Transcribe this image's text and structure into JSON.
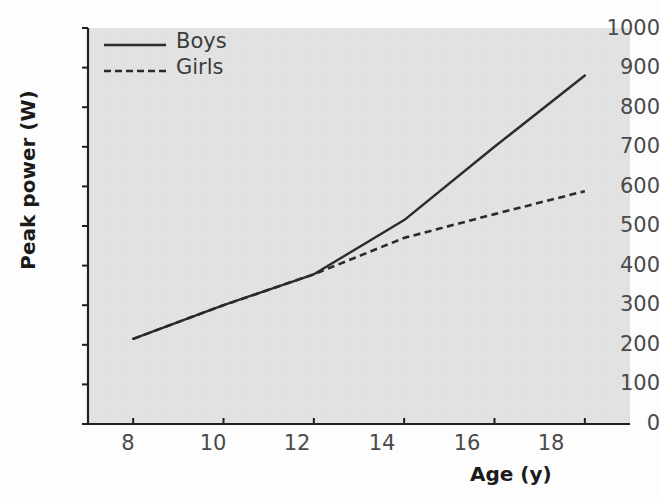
{
  "chart_data": {
    "type": "line",
    "title": "",
    "xlabel": "Age (y)",
    "ylabel": "Peak power (W)",
    "xlim": [
      7,
      19
    ],
    "ylim": [
      0,
      1000
    ],
    "xticks": [
      8,
      10,
      12,
      14,
      16,
      18
    ],
    "yticks": [
      0,
      100,
      200,
      300,
      400,
      500,
      600,
      700,
      800,
      900,
      1000
    ],
    "grid": false,
    "legend_position": "top-left",
    "x": [
      8,
      10,
      12,
      14,
      16,
      18
    ],
    "series": [
      {
        "name": "Boys",
        "style": "solid",
        "color": "#2b2b2b",
        "values": [
          215,
          300,
          378,
          515,
          700,
          880
        ]
      },
      {
        "name": "Girls",
        "style": "dashed",
        "color": "#2b2b2b",
        "values": [
          215,
          300,
          378,
          470,
          530,
          588
        ]
      }
    ]
  },
  "axes": {
    "y_tick_labels": [
      "1000",
      "900",
      "800",
      "700",
      "600",
      "500",
      "400",
      "300",
      "200",
      "100",
      "0"
    ],
    "x_tick_labels": [
      "8",
      "10",
      "12",
      "14",
      "16",
      "18"
    ],
    "y_title": "Peak power (W)",
    "x_title": "Age (y)"
  },
  "legend": {
    "items": [
      {
        "label": "Boys",
        "style": "solid"
      },
      {
        "label": "Girls",
        "style": "dashed"
      }
    ]
  },
  "colors": {
    "panel_background": "#e2e2e2",
    "figure_background": "#fdfdfd",
    "line": "#2b2b2b",
    "axis": "#1f1f1f",
    "tick_label": "#4a4a4a",
    "axis_title": "#1b1b1b"
  }
}
